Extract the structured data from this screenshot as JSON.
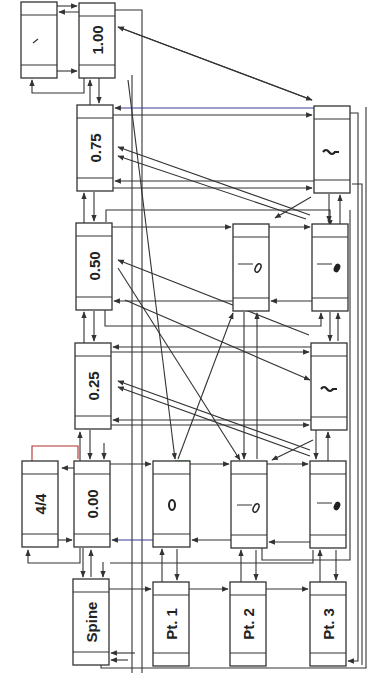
{
  "diagram": {
    "orientation": "rotated-90-ccw",
    "colors": {
      "line": "#333333",
      "accent_blue": "#3a3a9a",
      "accent_red": "#b03030",
      "accent_green": "#3f8a3f",
      "background": "#ffffff"
    },
    "nodes": [
      {
        "id": "slash",
        "label": "/",
        "kind": "barline",
        "x": 21,
        "y": 2,
        "w": 36,
        "h": 76
      },
      {
        "id": "t100",
        "label": "1.00",
        "kind": "time",
        "x": 79,
        "y": 3,
        "w": 36,
        "h": 75
      },
      {
        "id": "t075",
        "label": "0.75",
        "kind": "time",
        "x": 77,
        "y": 105,
        "w": 36,
        "h": 86
      },
      {
        "id": "t050",
        "label": "0.50",
        "kind": "time",
        "x": 76,
        "y": 223,
        "w": 36,
        "h": 87
      },
      {
        "id": "t025",
        "label": "0.25",
        "kind": "time",
        "x": 75,
        "y": 343,
        "w": 36,
        "h": 86
      },
      {
        "id": "t000",
        "label": "0.00",
        "kind": "time",
        "x": 74,
        "y": 461,
        "w": 36,
        "h": 86
      },
      {
        "id": "meter",
        "label": "4/4",
        "kind": "meter",
        "x": 22,
        "y": 461,
        "w": 36,
        "h": 86
      },
      {
        "id": "spine",
        "label": "Spine",
        "kind": "spine",
        "x": 73,
        "y": 579,
        "w": 36,
        "h": 86
      },
      {
        "id": "pt1",
        "label": "Pt. 1",
        "kind": "part",
        "x": 153,
        "y": 582,
        "w": 36,
        "h": 84
      },
      {
        "id": "pt2",
        "label": "Pt. 2",
        "kind": "part",
        "x": 230,
        "y": 582,
        "w": 36,
        "h": 84
      },
      {
        "id": "pt3",
        "label": "Pt. 3",
        "kind": "part",
        "x": 310,
        "y": 582,
        "w": 36,
        "h": 84
      },
      {
        "id": "whole",
        "label": "whole note",
        "kind": "note-whole",
        "x": 153,
        "y": 461,
        "w": 37,
        "h": 86
      },
      {
        "id": "half_a",
        "label": "half note",
        "kind": "note-half",
        "x": 231,
        "y": 461,
        "w": 36,
        "h": 87
      },
      {
        "id": "quarter_a",
        "label": "quarter note",
        "kind": "note-quarter",
        "x": 310,
        "y": 461,
        "w": 36,
        "h": 87
      },
      {
        "id": "half_b",
        "label": "half note",
        "kind": "note-half",
        "x": 233,
        "y": 224,
        "w": 36,
        "h": 87
      },
      {
        "id": "quarter_b",
        "label": "quarter note",
        "kind": "note-quarter",
        "x": 312,
        "y": 224,
        "w": 36,
        "h": 87
      },
      {
        "id": "rest_a",
        "label": "quarter rest",
        "kind": "rest",
        "x": 311,
        "y": 343,
        "w": 36,
        "h": 87
      },
      {
        "id": "rest_b",
        "label": "quarter rest",
        "kind": "rest",
        "x": 314,
        "y": 106,
        "w": 36,
        "h": 87
      }
    ],
    "edges": [
      {
        "from": "slash",
        "to": "t100"
      },
      {
        "from": "t100",
        "to": "slash"
      },
      {
        "from": "t100",
        "to": "t075"
      },
      {
        "from": "t075",
        "to": "t100"
      },
      {
        "from": "t075",
        "to": "t050"
      },
      {
        "from": "t050",
        "to": "t075"
      },
      {
        "from": "t050",
        "to": "t025"
      },
      {
        "from": "t025",
        "to": "t050"
      },
      {
        "from": "t025",
        "to": "t000"
      },
      {
        "from": "t000",
        "to": "t025"
      },
      {
        "from": "t000",
        "to": "meter"
      },
      {
        "from": "meter",
        "to": "t000"
      },
      {
        "from": "t000",
        "to": "spine"
      },
      {
        "from": "spine",
        "to": "t000"
      },
      {
        "from": "spine",
        "to": "pt1"
      },
      {
        "from": "pt1",
        "to": "pt2"
      },
      {
        "from": "pt2",
        "to": "pt3"
      },
      {
        "from": "pt1",
        "to": "whole"
      },
      {
        "from": "whole",
        "to": "pt1"
      },
      {
        "from": "pt2",
        "to": "half_a"
      },
      {
        "from": "half_a",
        "to": "pt2"
      },
      {
        "from": "pt3",
        "to": "quarter_a"
      },
      {
        "from": "quarter_a",
        "to": "pt3"
      },
      {
        "from": "quarter_a",
        "to": "rest_a"
      },
      {
        "from": "rest_a",
        "to": "quarter_a"
      },
      {
        "from": "rest_a",
        "to": "quarter_b"
      },
      {
        "from": "quarter_b",
        "to": "rest_a"
      },
      {
        "from": "quarter_b",
        "to": "rest_b"
      },
      {
        "from": "rest_b",
        "to": "quarter_b"
      },
      {
        "from": "half_a",
        "to": "half_b"
      },
      {
        "from": "half_b",
        "to": "half_a"
      },
      {
        "from": "t000",
        "to": "whole"
      },
      {
        "from": "t000",
        "to": "half_a"
      },
      {
        "from": "t000",
        "to": "quarter_a"
      },
      {
        "from": "t025",
        "to": "rest_a"
      },
      {
        "from": "t050",
        "to": "half_b"
      },
      {
        "from": "t050",
        "to": "quarter_b"
      },
      {
        "from": "t075",
        "to": "rest_b"
      },
      {
        "from": "rest_b",
        "to": "t100"
      }
    ]
  }
}
